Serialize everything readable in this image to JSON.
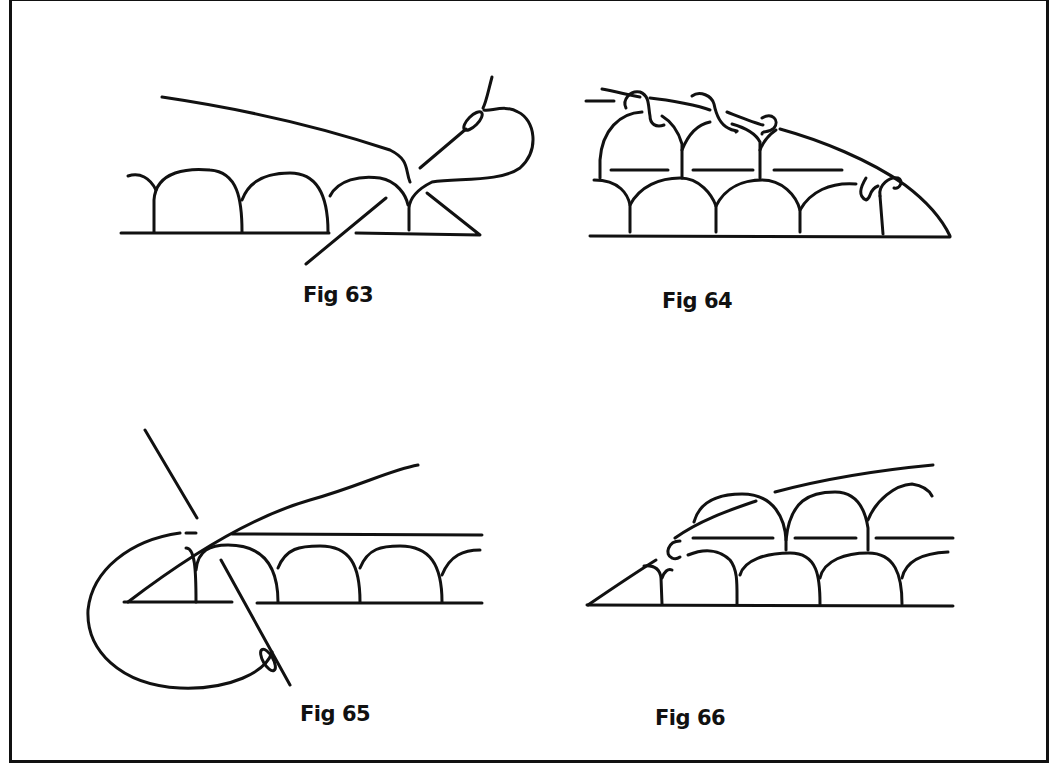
{
  "page": {
    "background": "#ffffff",
    "ink_color": "#111111"
  },
  "figures": [
    {
      "id": "fig63",
      "caption": "Fig 63",
      "description": "Needle and loop threaded through last arch of scalloped row"
    },
    {
      "id": "fig64",
      "caption": "Fig 64",
      "description": "Second row of arches with knotted picots along a sloping thread"
    },
    {
      "id": "fig65",
      "caption": "Fig 65",
      "description": "Needle passing a large loop under the base row at the start of a row"
    },
    {
      "id": "fig66",
      "caption": "Fig 66",
      "description": "Upper arch row begun with a knotted link at the slanted edge"
    }
  ]
}
